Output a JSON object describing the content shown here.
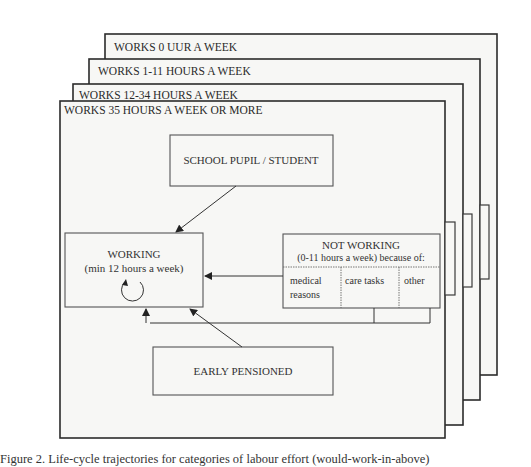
{
  "figure": {
    "frames": [
      {
        "label": "WORKS 0 UUR A WEEK",
        "x": 105,
        "y": 34,
        "w": 392,
        "h": 341,
        "tab": null
      },
      {
        "label": "WORKS 1-11 HOURS A WEEK",
        "x": 89,
        "y": 59,
        "w": 391,
        "h": 341,
        "tab": {
          "x": 480,
          "y": 205,
          "w": 9,
          "h": 74
        }
      },
      {
        "label": "WORKS 12-34 HOURS A WEEK",
        "x": 73,
        "y": 84,
        "w": 390,
        "h": 341,
        "tab": {
          "x": 463,
          "y": 214,
          "w": 9,
          "h": 73
        }
      },
      {
        "label": "WORKS 35 HOURS A WEEK OR MORE",
        "x": 60,
        "y": 101,
        "w": 385,
        "h": 337,
        "tab": {
          "x": 445,
          "y": 222,
          "w": 10,
          "h": 73
        }
      }
    ],
    "school_box": {
      "label": "SCHOOL PUPIL / STUDENT"
    },
    "working_box": {
      "title": "WORKING",
      "subtitle": "(min 12 hours a week)",
      "loop_icon": "circular-arrow-icon"
    },
    "not_working_box": {
      "title": "NOT WORKING",
      "subtitle": "(0-11 hours a week) because of:",
      "reasons": [
        {
          "line1": "medical",
          "line2": "reasons"
        },
        {
          "line1": "care tasks",
          "line2": ""
        },
        {
          "line1": "other",
          "line2": ""
        }
      ]
    },
    "pensioned_box": {
      "label": "EARLY PENSIONED"
    },
    "colors": {
      "line": "#2b2b2b",
      "fill": "#f7f7f5",
      "background": "#ffffff"
    }
  },
  "caption": "Figure 2. Life-cycle trajectories for categories of labour effort (would-work-in-above)"
}
